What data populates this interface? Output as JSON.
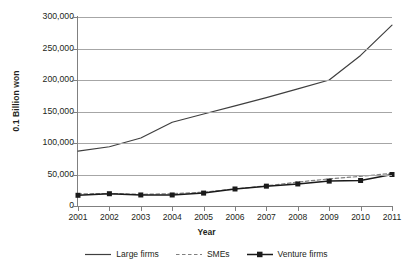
{
  "chart_data": {
    "type": "line",
    "title": "",
    "xlabel": "Year",
    "ylabel": "0.1 Billion won",
    "categories": [
      "2001",
      "2002",
      "2003",
      "2004",
      "2005",
      "2006",
      "2007",
      "2008",
      "2009",
      "2010",
      "2011"
    ],
    "x": [
      2001,
      2002,
      2003,
      2004,
      2005,
      2006,
      2007,
      2008,
      2009,
      2010,
      2011
    ],
    "ylim": [
      0,
      300000
    ],
    "ytick_labels": [
      "300,000",
      "250,000",
      "200,000",
      "150,000",
      "100,000",
      "50,000",
      "0"
    ],
    "ytick_values": [
      300000,
      250000,
      200000,
      150000,
      100000,
      50000,
      0
    ],
    "grid": true,
    "legend_position": "bottom",
    "series": [
      {
        "name": "Large firms",
        "style": "solid",
        "marker": "none",
        "color": "#3f3f3f",
        "values": [
          87000,
          94000,
          108000,
          133000,
          146000,
          159000,
          172000,
          186000,
          200000,
          239000,
          287000
        ]
      },
      {
        "name": "SMEs",
        "style": "dashed",
        "marker": "none",
        "color": "#808080",
        "values": [
          19000,
          20000,
          18500,
          19500,
          22000,
          27000,
          32000,
          38000,
          43000,
          47000,
          52000
        ]
      },
      {
        "name": "Venture firms",
        "style": "solid",
        "marker": "square",
        "color": "#1a1a1a",
        "values": [
          17000,
          19500,
          17500,
          17500,
          20500,
          27000,
          31500,
          35000,
          39500,
          40500,
          50000
        ]
      }
    ]
  }
}
